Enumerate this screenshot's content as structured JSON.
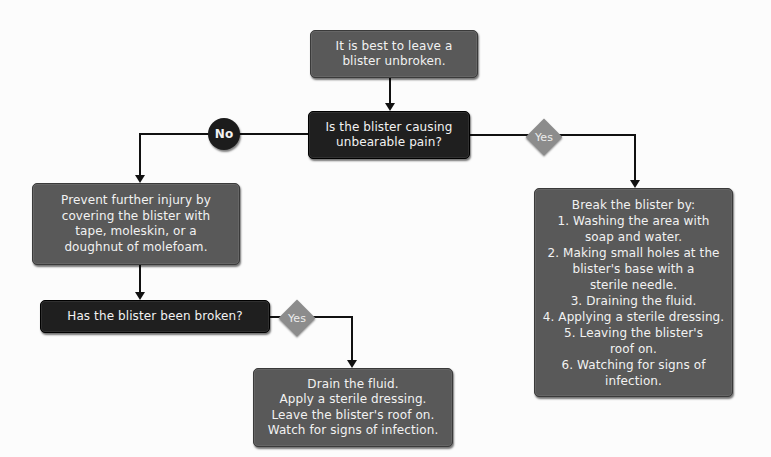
{
  "diagram": {
    "type": "flowchart",
    "colors": {
      "background": "#fcfcfc",
      "box_gray": "#595959",
      "box_dark": "#1f1f1f",
      "yes_diamond": "#8c8c8c",
      "no_circle": "#1c1c1c",
      "text": "#f2f2f2",
      "connector": "#111111"
    },
    "nodes": {
      "start": {
        "lines": [
          "It is best to leave a",
          "blister unbroken."
        ]
      },
      "question_pain": {
        "lines": [
          "Is the blister causing",
          "unbearable pain?"
        ]
      },
      "prevent_injury": {
        "lines": [
          "Prevent further injury by",
          "covering the blister with",
          "tape, moleskin, or a",
          "doughnut of molefoam."
        ]
      },
      "break_blister": {
        "lines": [
          "Break the blister by:",
          "1.  Washing the area with",
          "soap and water.",
          "2. Making small holes at the",
          "blister's base with a",
          "sterile needle.",
          "3. Draining the fluid.",
          "4. Applying a sterile dressing.",
          "5. Leaving the blister's",
          "roof on.",
          "6. Watching for signs of",
          "infection."
        ]
      },
      "question_broken": {
        "lines": [
          "Has the blister been broken?"
        ]
      },
      "drain": {
        "lines": [
          "Drain the fluid.",
          "Apply a sterile dressing.",
          "Leave the blister's roof on.",
          "Watch for signs of infection."
        ]
      }
    },
    "labels": {
      "no": "No",
      "yes_pain": "Yes",
      "yes_broken": "Yes"
    },
    "edges": [
      {
        "from": "start",
        "to": "question_pain",
        "label": ""
      },
      {
        "from": "question_pain",
        "to": "prevent_injury",
        "label": "No"
      },
      {
        "from": "question_pain",
        "to": "break_blister",
        "label": "Yes"
      },
      {
        "from": "prevent_injury",
        "to": "question_broken",
        "label": ""
      },
      {
        "from": "question_broken",
        "to": "drain",
        "label": "Yes"
      }
    ]
  }
}
